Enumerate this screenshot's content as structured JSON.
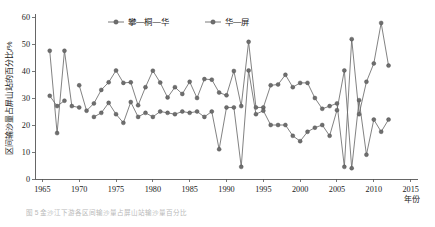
{
  "chart_data": {
    "type": "line",
    "title": "",
    "xlabel": "年份",
    "ylabel": "区间输沙量占屏山站的百分比/%",
    "xlim": [
      1964,
      2016
    ],
    "ylim": [
      0,
      60
    ],
    "grid": false,
    "legend_position": "top-center",
    "x_ticks": [
      1965,
      1970,
      1975,
      1980,
      1985,
      1990,
      1995,
      2000,
      2005,
      2010,
      2015
    ],
    "y_ticks": [
      0,
      10,
      20,
      30,
      40,
      50,
      60
    ],
    "marker": "filled-circle",
    "series": [
      {
        "name": "攀—桐—华",
        "color": "#6e6e6e",
        "points": [
          [
            1966,
            30.8
          ],
          [
            1967,
            27.0
          ],
          [
            1968,
            29.0
          ],
          [
            1970,
            34.7
          ],
          [
            1971,
            25.3
          ],
          [
            1972,
            28.0
          ],
          [
            1973,
            33.0
          ],
          [
            1974,
            35.8
          ],
          [
            1975,
            40.2
          ],
          [
            1976,
            35.6
          ],
          [
            1977,
            35.8
          ],
          [
            1978,
            27.3
          ],
          [
            1979,
            34.0
          ],
          [
            1980,
            40.1
          ],
          [
            1981,
            35.7
          ],
          [
            1982,
            30.2
          ],
          [
            1983,
            34.0
          ],
          [
            1984,
            31.5
          ],
          [
            1985,
            36.0
          ],
          [
            1986,
            30.0
          ],
          [
            1987,
            37.0
          ],
          [
            1988,
            36.8
          ],
          [
            1989,
            32.0
          ],
          [
            1990,
            31.0
          ],
          [
            1991,
            40.0
          ],
          [
            1992,
            27.0
          ],
          [
            1993,
            50.8
          ],
          [
            1994,
            26.5
          ],
          [
            1995,
            26.5
          ],
          [
            1996,
            34.7
          ],
          [
            1997,
            35.0
          ],
          [
            1998,
            38.6
          ],
          [
            1999,
            34.0
          ],
          [
            2000,
            35.6
          ],
          [
            2001,
            35.6
          ],
          [
            2002,
            30.0
          ],
          [
            2003,
            26.0
          ],
          [
            2004,
            27.0
          ],
          [
            2005,
            28.0
          ],
          [
            2006,
            4.5
          ],
          [
            2007,
            51.8
          ],
          [
            2008,
            24.0
          ],
          [
            2009,
            36.0
          ],
          [
            2010,
            42.8
          ],
          [
            2011,
            57.8
          ],
          [
            2012,
            42.0
          ]
        ]
      },
      {
        "name": "华—屏",
        "color": "#6e6e6e",
        "points": [
          [
            1966,
            47.5
          ],
          [
            1967,
            17.0
          ],
          [
            1968,
            47.5
          ],
          [
            1969,
            27.0
          ],
          [
            1970,
            26.5
          ],
          [
            1972,
            23.0
          ],
          [
            1973,
            24.5
          ],
          [
            1974,
            28.2
          ],
          [
            1975,
            24.0
          ],
          [
            1976,
            20.8
          ],
          [
            1977,
            28.5
          ],
          [
            1978,
            23.0
          ],
          [
            1979,
            24.5
          ],
          [
            1980,
            23.0
          ],
          [
            1981,
            25.0
          ],
          [
            1982,
            24.5
          ],
          [
            1983,
            24.0
          ],
          [
            1984,
            25.0
          ],
          [
            1985,
            24.5
          ],
          [
            1986,
            25.0
          ],
          [
            1987,
            23.0
          ],
          [
            1988,
            25.0
          ],
          [
            1989,
            11.0
          ],
          [
            1990,
            26.5
          ],
          [
            1991,
            26.5
          ],
          [
            1992,
            4.5
          ],
          [
            1993,
            40.2
          ],
          [
            1994,
            24.0
          ],
          [
            1995,
            25.3
          ],
          [
            1996,
            20.0
          ],
          [
            1997,
            20.0
          ],
          [
            1998,
            20.0
          ],
          [
            1999,
            16.0
          ],
          [
            2000,
            14.0
          ],
          [
            2001,
            17.5
          ],
          [
            2002,
            19.0
          ],
          [
            2003,
            20.0
          ],
          [
            2004,
            16.0
          ],
          [
            2005,
            25.5
          ],
          [
            2006,
            40.2
          ],
          [
            2007,
            4.0
          ],
          [
            2008,
            29.2
          ],
          [
            2009,
            9.0
          ],
          [
            2010,
            22.0
          ],
          [
            2011,
            17.5
          ],
          [
            2012,
            22.0
          ]
        ]
      }
    ]
  },
  "legend": {
    "items": [
      {
        "label": "攀—桐—华"
      },
      {
        "label": "华—屏"
      }
    ]
  },
  "caption": "图 5  金沙江下游各区间输沙量占屏山站输沙量百分比"
}
